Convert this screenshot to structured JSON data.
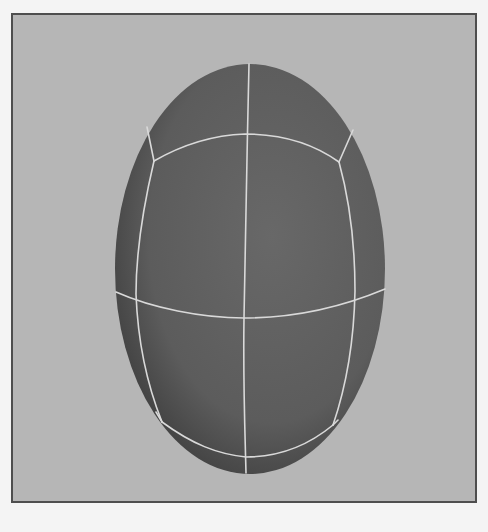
{
  "figure": {
    "colors": {
      "page_background": "#f4f4f4",
      "viewport_background": "#b6b6b6",
      "viewport_border": "#4e4e4e",
      "surface": "#5e5e5e",
      "surface_shadow": "#3e3e3e",
      "surface_highlight": "#6a6a6a",
      "wire": "#d9d9d9"
    },
    "ellipsoid": {
      "cx": 248,
      "cy": 267,
      "rx": 135,
      "ry": 205
    }
  }
}
